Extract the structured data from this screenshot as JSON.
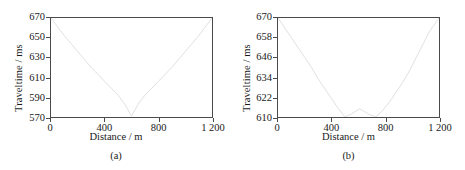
{
  "figure": {
    "panel_count": 2,
    "background_color": "#ffffff",
    "frame_color": "#4a4a4a",
    "curve_color": "#dcdcdc",
    "text_color": "#1a1a1a"
  },
  "chart_data": [
    {
      "type": "line",
      "panel_label": "(a)",
      "title": "",
      "xlabel": "Distance / m",
      "ylabel": "Traveltime / ms",
      "xlim": [
        0,
        1200
      ],
      "ylim": [
        570,
        670
      ],
      "xticks": [
        0,
        400,
        800,
        1200
      ],
      "xticklabels": [
        "0",
        "400",
        "800",
        "1 200"
      ],
      "yticks": [
        570,
        590,
        610,
        630,
        650,
        670
      ],
      "yticklabels": [
        "570",
        "590",
        "610",
        "630",
        "650",
        "670"
      ],
      "grid": false,
      "legend": "none",
      "series": [
        {
          "name": "traveltime",
          "color": "#dcdcdc",
          "x": [
            0,
            50,
            100,
            150,
            200,
            250,
            300,
            350,
            400,
            450,
            500,
            550,
            600,
            650,
            700,
            750,
            800,
            850,
            900,
            950,
            1000,
            1050,
            1100,
            1150,
            1200
          ],
          "y": [
            670,
            661,
            652,
            644,
            636,
            628,
            620,
            613,
            606,
            599,
            592,
            583,
            571,
            583,
            592,
            599,
            606,
            613,
            620,
            628,
            636,
            644,
            652,
            661,
            670
          ]
        }
      ]
    },
    {
      "type": "line",
      "panel_label": "(b)",
      "title": "",
      "xlabel": "Distance / m",
      "ylabel": "Traveltime / ms",
      "xlim": [
        0,
        1200
      ],
      "ylim": [
        610,
        670
      ],
      "xticks": [
        0,
        400,
        800,
        1200
      ],
      "xticklabels": [
        "0",
        "400",
        "800",
        "1 200"
      ],
      "yticks": [
        610,
        622,
        634,
        646,
        658,
        670
      ],
      "yticklabels": [
        "610",
        "622",
        "634",
        "646",
        "658",
        "670"
      ],
      "grid": false,
      "legend": "none",
      "series": [
        {
          "name": "traveltime",
          "color": "#dcdcdc",
          "x": [
            0,
            50,
            100,
            150,
            200,
            250,
            300,
            350,
            400,
            450,
            500,
            550,
            610,
            670,
            730,
            780,
            830,
            880,
            930,
            980,
            1030,
            1080,
            1130,
            1200
          ],
          "y": [
            670,
            664,
            658,
            652,
            646,
            640,
            633,
            627,
            621,
            615,
            610,
            612,
            615,
            612,
            610,
            614,
            619,
            625,
            631,
            638,
            646,
            654,
            662,
            670
          ]
        }
      ]
    }
  ]
}
